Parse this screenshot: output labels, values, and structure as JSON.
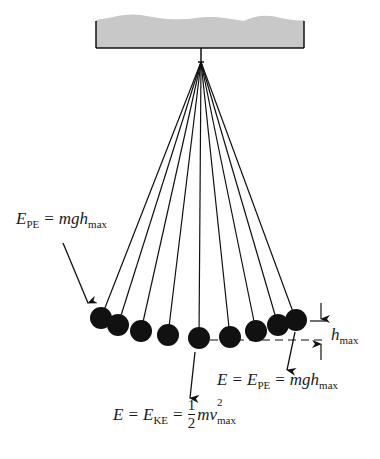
{
  "figure": {
    "type": "pendulum-energy-diagram",
    "colors": {
      "ceiling_fill": "#c8c8c8",
      "ink": "#111111",
      "background": "#ffffff"
    },
    "ceiling": {
      "x": 96,
      "y": 15,
      "width": 208,
      "height": 33
    },
    "pivot": {
      "x": 201,
      "y": 62
    },
    "bob_radius": 11,
    "bobs": [
      {
        "x": 101,
        "y": 318
      },
      {
        "x": 118,
        "y": 325
      },
      {
        "x": 141,
        "y": 331
      },
      {
        "x": 168,
        "y": 335
      },
      {
        "x": 199,
        "y": 338
      },
      {
        "x": 230,
        "y": 337
      },
      {
        "x": 256,
        "y": 331
      },
      {
        "x": 278,
        "y": 325
      },
      {
        "x": 296,
        "y": 320
      }
    ]
  },
  "labels": {
    "left_top": {
      "E": "E",
      "sub": "PE",
      "eq": "=",
      "rhs": "mgh",
      "rhs_sub": "max"
    },
    "height_marker": {
      "h": "h",
      "sub": "max"
    },
    "right_bottom": {
      "E": "E",
      "eq1": "=",
      "E2": "E",
      "sub": "PE",
      "eq2": "=",
      "rhs": "mgh",
      "rhs_sub": "max"
    },
    "bottom": {
      "E": "E",
      "eq1": "=",
      "E2": "E",
      "sub": "KE",
      "eq2": "=",
      "frac_num": "1",
      "frac_den": "2",
      "rhs": "mv",
      "sup": "2",
      "rhs_sub": "max"
    }
  }
}
